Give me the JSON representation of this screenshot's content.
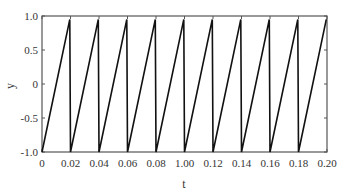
{
  "chart_data": {
    "type": "line",
    "title": "",
    "xlabel": "t",
    "ylabel": "y",
    "xlim": [
      0,
      0.2
    ],
    "ylim": [
      -1.0,
      1.0
    ],
    "x_ticks": [
      0,
      0.02,
      0.04,
      0.06,
      0.08,
      0.1,
      0.12,
      0.14,
      0.16,
      0.18,
      0.2
    ],
    "x_tick_labels": [
      "0",
      "0.02",
      "0.04",
      "0.06",
      "0.08",
      "1.00",
      "0.12",
      "0.14",
      "0.16",
      "0.18",
      "0.20"
    ],
    "y_ticks": [
      -1.0,
      -0.5,
      0,
      0.5,
      1.0
    ],
    "y_tick_labels": [
      "-1.0",
      "-0.5",
      "0",
      "0.5",
      "1.0"
    ],
    "grid": false,
    "legend": null,
    "series": [
      {
        "name": "sawtooth",
        "period": 0.02,
        "min": -1.0,
        "max": 0.95,
        "x": [
          0,
          0.0195,
          0.02,
          0.0395,
          0.04,
          0.0595,
          0.06,
          0.0795,
          0.08,
          0.0995,
          0.1,
          0.1195,
          0.12,
          0.1395,
          0.14,
          0.1595,
          0.16,
          0.1795,
          0.18,
          0.1995
        ],
        "values": [
          -1.0,
          0.95,
          -1.0,
          0.95,
          -1.0,
          0.95,
          -1.0,
          0.95,
          -1.0,
          0.95,
          -1.0,
          0.95,
          -1.0,
          0.95,
          -1.0,
          0.95,
          -1.0,
          0.95,
          -1.0,
          0.95
        ]
      }
    ]
  }
}
